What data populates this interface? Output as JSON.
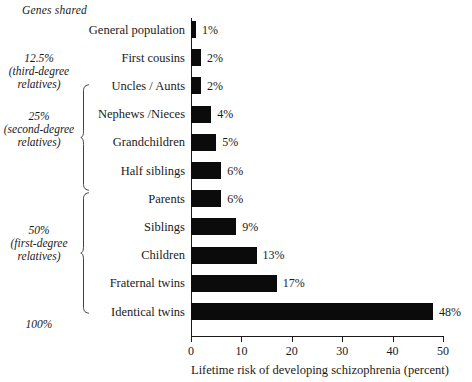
{
  "header": {
    "genes_shared_label": "Genes shared"
  },
  "genes_groups": [
    {
      "percent": "12.5%",
      "subtitle_line1": "(third-degree",
      "subtitle_line2": "relatives)",
      "top": 52,
      "has_brace": false
    },
    {
      "percent": "25%",
      "subtitle_line1": "(second-degree",
      "subtitle_line2": "relatives)",
      "top": 110,
      "has_brace": true,
      "brace_top": 84,
      "brace_height": 107
    },
    {
      "percent": "50%",
      "subtitle_line1": "(first-degree",
      "subtitle_line2": "relatives)",
      "top": 224,
      "has_brace": true,
      "brace_top": 192,
      "brace_height": 122
    },
    {
      "percent": "100%",
      "subtitle_line1": "",
      "subtitle_line2": "",
      "top": 318,
      "has_brace": false
    }
  ],
  "axis": {
    "x_title": "Lifetime risk of developing schizophrenia (percent)",
    "x_min": 0,
    "x_max": 50,
    "x_ticks": [
      0,
      10,
      20,
      30,
      40,
      50
    ],
    "x_tick_labels": [
      "0",
      "10",
      "20",
      "30",
      "40",
      "50"
    ]
  },
  "chart_data": {
    "type": "bar",
    "orientation": "horizontal",
    "title": "",
    "xlabel": "Lifetime risk of developing schizophrenia (percent)",
    "ylabel": "",
    "xlim": [
      0,
      50
    ],
    "grid": false,
    "legend": false,
    "bar_color": "#0b0b0b",
    "value_suffix": "%",
    "categories": [
      "General population",
      "First cousins",
      "Uncles / Aunts",
      "Nephews /Nieces",
      "Grandchildren",
      "Half siblings",
      "Parents",
      "Siblings",
      "Children",
      "Fraternal twins",
      "Identical twins"
    ],
    "values": [
      1,
      2,
      2,
      4,
      5,
      6,
      6,
      9,
      13,
      17,
      48
    ],
    "value_labels": [
      "1%",
      "2%",
      "2%",
      "4%",
      "5%",
      "6%",
      "6%",
      "9%",
      "13%",
      "17%",
      "48%"
    ],
    "group_annotations": [
      {
        "label": "12.5% (third-degree relatives)",
        "categories": [
          "First cousins"
        ]
      },
      {
        "label": "25% (second-degree relatives)",
        "categories": [
          "Uncles / Aunts",
          "Nephews /Nieces",
          "Grandchildren",
          "Half siblings"
        ]
      },
      {
        "label": "50% (first-degree relatives)",
        "categories": [
          "Parents",
          "Siblings",
          "Children",
          "Fraternal twins"
        ]
      },
      {
        "label": "100%",
        "categories": [
          "Identical twins"
        ]
      }
    ]
  }
}
